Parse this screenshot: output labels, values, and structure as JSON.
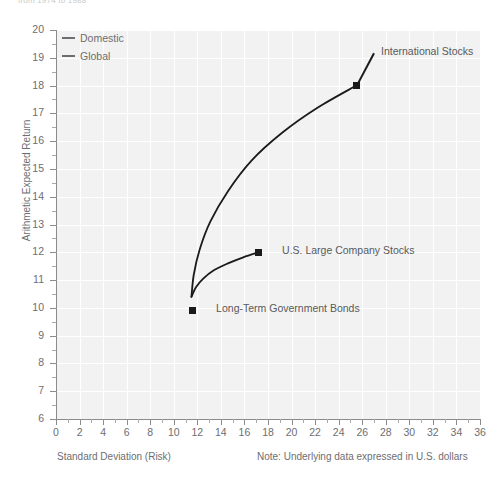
{
  "header": {
    "clipped_text": "from 1974 to 1988"
  },
  "legend": {
    "position": "top-left-inside",
    "items": [
      {
        "label": "Domestic",
        "color": "#6d6e71"
      },
      {
        "label": "Global",
        "color": "#6d6e71"
      }
    ]
  },
  "axes": {
    "x_title": "Standard Deviation (Risk)",
    "y_title": "Arithmetic Expected Return"
  },
  "note": "Note: Underlying data expressed in U.S. dollars",
  "chart_data": {
    "type": "line",
    "title": "",
    "subtitle": "",
    "xlabel": "Standard Deviation (Risk)",
    "ylabel": "Arithmetic Expected Return",
    "xlim": [
      0,
      36
    ],
    "ylim": [
      6,
      20
    ],
    "xticks": [
      0,
      2,
      4,
      6,
      8,
      10,
      12,
      14,
      16,
      18,
      20,
      22,
      24,
      26,
      28,
      30,
      32,
      34,
      36
    ],
    "xticks_minor": [
      1,
      3,
      5,
      7,
      9,
      11,
      13,
      15,
      17,
      19,
      21,
      23,
      25,
      27,
      29,
      31,
      33,
      35
    ],
    "yticks": [
      6,
      7,
      8,
      9,
      10,
      11,
      12,
      13,
      14,
      15,
      16,
      17,
      18,
      19,
      20
    ],
    "grid": true,
    "grid_color": "#ffffff",
    "plot_background": "#f2f2f2",
    "legend_position": "upper left",
    "series": [
      {
        "name": "Domestic",
        "color": "#1a1a1a",
        "points": [
          {
            "x": 11.5,
            "y": 10.4
          },
          {
            "x": 11.9,
            "y": 10.75
          },
          {
            "x": 12.5,
            "y": 11.05
          },
          {
            "x": 13.4,
            "y": 11.35
          },
          {
            "x": 14.6,
            "y": 11.6
          },
          {
            "x": 15.9,
            "y": 11.82
          },
          {
            "x": 17.2,
            "y": 12.0
          }
        ]
      },
      {
        "name": "Global",
        "color": "#1a1a1a",
        "points": [
          {
            "x": 11.5,
            "y": 10.4
          },
          {
            "x": 11.7,
            "y": 11.2
          },
          {
            "x": 12.2,
            "y": 12.1
          },
          {
            "x": 13.1,
            "y": 13.1
          },
          {
            "x": 14.6,
            "y": 14.2
          },
          {
            "x": 16.6,
            "y": 15.3
          },
          {
            "x": 19.2,
            "y": 16.3
          },
          {
            "x": 22.2,
            "y": 17.2
          },
          {
            "x": 25.5,
            "y": 18.0
          }
        ]
      }
    ],
    "annotations": [
      {
        "label": "International Stocks",
        "x": 25.5,
        "y": 18.0,
        "label_x": 27.0,
        "label_y": 19.2
      },
      {
        "label": "U.S. Large Company Stocks",
        "x": 17.2,
        "y": 12.0,
        "label_x": 18.6,
        "label_y": 12.05
      },
      {
        "label": "Long-Term Government Bonds",
        "x": 11.6,
        "y": 9.9,
        "label_x": 13.0,
        "label_y": 9.95
      }
    ]
  }
}
